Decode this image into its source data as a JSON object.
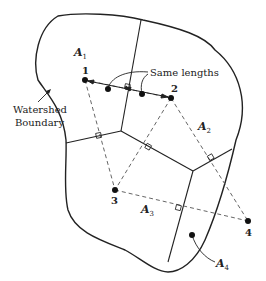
{
  "diagram": {
    "annotations": {
      "watershed_line1": "Watershed",
      "watershed_line2": "Boundary",
      "same_lengths": "Same lengths"
    },
    "gauges": [
      {
        "id": "1",
        "label": "1"
      },
      {
        "id": "2",
        "label": "2"
      },
      {
        "id": "3",
        "label": "3"
      },
      {
        "id": "4",
        "label": "4"
      }
    ],
    "areas": [
      {
        "id": "A1",
        "base": "A",
        "sub": "1"
      },
      {
        "id": "A2",
        "base": "A",
        "sub": "2"
      },
      {
        "id": "A3",
        "base": "A",
        "sub": "3"
      },
      {
        "id": "A4",
        "base": "A",
        "sub": "4"
      }
    ],
    "colors": {
      "stroke": "#222222",
      "dashed": "#555555"
    }
  }
}
